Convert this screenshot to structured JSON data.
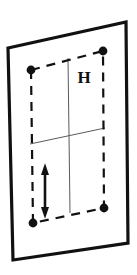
{
  "figure": {
    "background_color": "#ffffff",
    "ink_color": "#111111",
    "labels": [
      {
        "name": "height-label",
        "text": "H",
        "x": 84,
        "y": 83
      }
    ],
    "outer_frame": {
      "name": "outer-parallelogram",
      "stroke_color": "#111111",
      "stroke_width": 3.2,
      "points": "8,48 126,22 128,243 13,260"
    },
    "dashed_rectangle": {
      "name": "dashed-rectangle",
      "stroke_color": "#111111",
      "stroke_width": 2.2,
      "dash_pattern": "9 7",
      "corners": [
        {
          "name": "corner-top-left",
          "x": 31,
          "y": 70
        },
        {
          "name": "corner-top-right",
          "x": 103,
          "y": 51
        },
        {
          "name": "corner-bottom-right",
          "x": 104,
          "y": 208
        },
        {
          "name": "corner-bottom-left",
          "x": 33,
          "y": 223
        }
      ]
    },
    "corner_dots": {
      "name": "corner-dot",
      "radius": 4.4,
      "fill_color": "#111111"
    },
    "grid_lines": [
      {
        "name": "grid-line-vertical",
        "stroke_color": "#5a5a5a",
        "stroke_width": 1.0,
        "x1": 68,
        "y1": 58,
        "x2": 70,
        "y2": 213
      },
      {
        "name": "grid-line-horizontal",
        "stroke_color": "#5a5a5a",
        "stroke_width": 1.0,
        "x1": 30,
        "y1": 144,
        "x2": 105,
        "y2": 128
      }
    ],
    "dimension_arrow": {
      "name": "height-dimension-arrow",
      "stroke_color": "#111111",
      "stroke_width": 2.6,
      "x": 45,
      "y_top": 170,
      "y_bottom": 212,
      "head_size": 6.5,
      "double_headed": true
    }
  }
}
